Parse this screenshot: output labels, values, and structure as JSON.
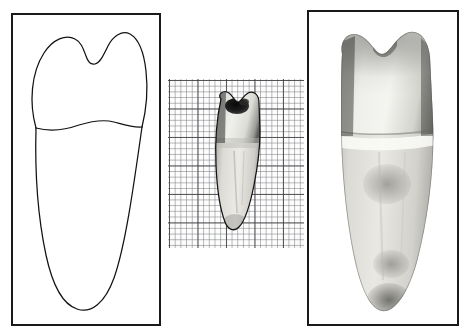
{
  "figure": {
    "background_color": "#ffffff",
    "width": 469,
    "height": 335
  },
  "panels": [
    {
      "id": "line-drawing",
      "name": "schematic-line-drawing-panel",
      "label": "Line drawing outline of tooth (buccal/lingual aspect)",
      "frame": {
        "x": 11,
        "y": 13,
        "width": 150,
        "height": 313
      },
      "border_color": "#1a1a1a",
      "fill_color": "#ffffff",
      "content_kind": "line-art",
      "features": [
        {
          "name": "crown-outline",
          "description": "Two-cusped crown with a shallow central developmental groove notch between the cusps"
        },
        {
          "name": "cervical-line",
          "description": "Wavy cementoenamel junction line separating crown from root"
        },
        {
          "name": "root-outline",
          "description": "Long single tapering root ending in a rounded apex"
        }
      ]
    },
    {
      "id": "graph-paper",
      "name": "graph-paper-specimen-panel",
      "label": "Extracted tooth specimen photographed on millimetre graph paper",
      "frame": {
        "x": 168,
        "y": 79,
        "width": 136,
        "height": 169
      },
      "content_kind": "photograph-on-grid",
      "grid": {
        "minor_spacing_px": 5.7,
        "major_spacing_px": 28.5,
        "minor_color": "#787a7e",
        "major_color": "#3c3c3e",
        "paper_color": "#fdfdfd"
      },
      "specimen": {
        "name": "middle-tooth-specimen",
        "x": 36,
        "y": 6,
        "width": 62,
        "height": 152,
        "features": [
          {
            "name": "occlusal-cavity",
            "description": "Dark carious lesion / cavity preparation on the occlusal surface of the crown"
          },
          {
            "name": "enamel-crown",
            "description": "Bright reflective enamel crown"
          },
          {
            "name": "root-body",
            "description": "Grey dentine root tapering to a blunt apex"
          }
        ]
      }
    },
    {
      "id": "photo-enlarged",
      "name": "enlarged-photograph-panel",
      "label": "Enlarged grayscale photograph of the same tooth",
      "frame": {
        "x": 307,
        "y": 10,
        "width": 152,
        "height": 316
      },
      "border_color": "#1a1a1a",
      "content_kind": "photograph",
      "features": [
        {
          "name": "crown",
          "description": "Broad two-cusped enamel crown with darker shaded proximal margins"
        },
        {
          "name": "cervical-line",
          "description": "Light horizontal cementoenamel junction band across the tooth at the crown/root transition"
        },
        {
          "name": "root",
          "description": "Long tapering root with mottled grey surface staining and a darker blotch near the apex"
        },
        {
          "name": "apex",
          "description": "Rounded, darkly stained root apex"
        }
      ]
    }
  ],
  "colors": {
    "frame_stroke": "#1a1a1a",
    "line_art_stroke": "#121212",
    "paper": "#ffffff",
    "grid_major": "#3c3c3e",
    "grid_minor": "#787a7e",
    "enamel_light": "#f2f2f0",
    "dentine_mid": "#c9c9c5",
    "shadow_dark": "#4a4a48",
    "cavity_dark": "#1e1e1e"
  }
}
